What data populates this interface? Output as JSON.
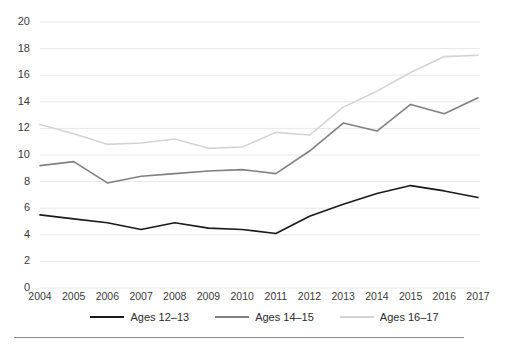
{
  "chart_data": {
    "type": "line",
    "title": "",
    "subtitle": "",
    "xlabel": "",
    "ylabel": "",
    "categories": [
      "2004",
      "2005",
      "2006",
      "2007",
      "2008",
      "2009",
      "2010",
      "2011",
      "2012",
      "2013",
      "2014",
      "2015",
      "2016",
      "2017"
    ],
    "x": [
      2004,
      2005,
      2006,
      2007,
      2008,
      2009,
      2010,
      2011,
      2012,
      2013,
      2014,
      2015,
      2016,
      2017
    ],
    "ylim": [
      0,
      20
    ],
    "xlim": [
      2004,
      2017
    ],
    "yticks": [
      0,
      2,
      4,
      6,
      8,
      10,
      12,
      14,
      16,
      18,
      20
    ],
    "ytick_labels": [
      "0",
      "2",
      "4",
      "6",
      "8",
      "10",
      "12",
      "14",
      "16",
      "18",
      "20"
    ],
    "grid": true,
    "grid_axis": "y",
    "legend_position": "bottom",
    "series": [
      {
        "name": "Ages 12–13",
        "color": "#1a1a1a",
        "values": [
          5.5,
          5.2,
          4.9,
          4.4,
          4.9,
          4.5,
          4.4,
          4.1,
          5.4,
          6.3,
          7.1,
          7.7,
          7.3,
          6.8
        ]
      },
      {
        "name": "Ages 14–15",
        "color": "#808080",
        "values": [
          9.2,
          9.5,
          7.9,
          8.4,
          8.6,
          8.8,
          8.9,
          8.6,
          10.3,
          12.4,
          11.8,
          13.8,
          13.1,
          14.3
        ]
      },
      {
        "name": "Ages 16–17",
        "color": "#d4d4d4",
        "values": [
          12.3,
          11.6,
          10.8,
          10.9,
          11.2,
          10.5,
          10.6,
          11.7,
          11.5,
          13.6,
          14.8,
          16.2,
          17.4,
          17.5
        ]
      }
    ]
  },
  "legend": {
    "items": [
      {
        "label": "Ages 12–13",
        "color": "#1a1a1a"
      },
      {
        "label": "Ages 14–15",
        "color": "#808080"
      },
      {
        "label": "Ages 16–17",
        "color": "#d4d4d4"
      }
    ]
  },
  "axes": {
    "y_labels": [
      "20",
      "18",
      "16",
      "14",
      "12",
      "10",
      "8",
      "6",
      "4",
      "2",
      "0"
    ],
    "x_labels": [
      "2004",
      "2005",
      "2006",
      "2007",
      "2008",
      "2009",
      "2010",
      "2011",
      "2012",
      "2013",
      "2014",
      "2015",
      "2016",
      "2017"
    ]
  },
  "colors": {
    "grid": "#e8e8e8",
    "axis_text": "#3a3a3a",
    "footer_rule": "#8a8a8a"
  }
}
